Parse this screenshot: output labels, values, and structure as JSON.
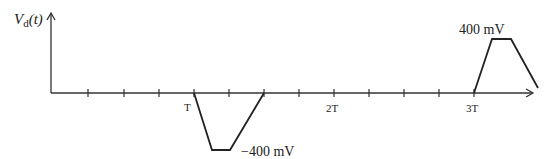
{
  "y_axis_label": "V",
  "y_axis_sub": "d",
  "y_axis_arg": "(t)",
  "tick_labels": {
    "T": "T",
    "2T": "2T",
    "3T": "3T"
  },
  "negative_pulse_label": "−400 mV",
  "positive_pulse_label": "400 mV",
  "colors": {
    "line": "#222222",
    "axis": "#333333"
  }
}
